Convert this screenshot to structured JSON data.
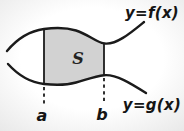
{
  "diagram": {
    "type": "area-between-curves",
    "labels": {
      "top_curve": "y=f(x)",
      "bottom_curve": "y=g(x)",
      "region": "S",
      "left_bound": "a",
      "right_bound": "b"
    },
    "colors": {
      "ink": "#1b1b1b",
      "region_fill": "#d2d2d2",
      "background": "#fcfcfc"
    },
    "paths": {
      "f_curve": "M 7 51 C 17 39 29 31 44 29 C 56 27.3 65 27 76 30.5 C 89 34.7 96 42.2 104 43.4 C 116 45.2 130 33.5 144 22",
      "g_curve": "M 8 64 C 18 75 30 82.5 44 84 C 56 85.3 65 85.6 76 82.5 C 89 78.7 96 76 104 75.2 C 116 74 131 83.5 146 93",
      "region": "M 44 29 C 56 27.3 65 27 76 30.5 C 89 34.7 96 42.2 104 43.4 L 104 75.2 C 96 76 89 78.7 76 82.5 C 65 85.6 56 85.3 44 84 Z",
      "a_line_solid": "M 44 29 L 44 84",
      "a_line_dashed": "M 44 87 L 44 104",
      "b_line_solid": "M 104 43.4 L 104 75.2",
      "b_line_dashed": "M 104 78 L 104 103"
    }
  }
}
